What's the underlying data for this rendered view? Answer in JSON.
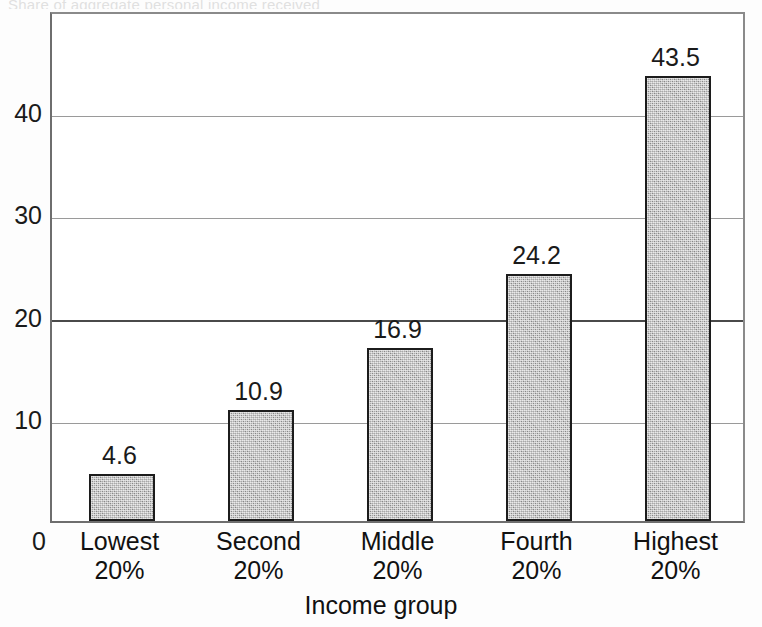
{
  "figure": {
    "cropped_title_sliver": "Share of aggregate personal income received",
    "background_color": "#ffffff",
    "bar_fill_color": "#a8a8a8",
    "bar_border_color": "#1c1c1c",
    "axis_color": "#6e6e6e",
    "gridline_color": "#9a9a9a",
    "emphasis_gridline_color": "#4a4a4a"
  },
  "chart_data": {
    "type": "bar",
    "title": "",
    "xlabel": "Income group",
    "ylabel": "",
    "categories": [
      "Lowest 20%",
      "Second 20%",
      "Middle 20%",
      "Fourth 20%",
      "Highest 20%"
    ],
    "category_lines": [
      [
        "Lowest",
        "20%"
      ],
      [
        "Second",
        "20%"
      ],
      [
        "Middle",
        "20%"
      ],
      [
        "Fourth",
        "20%"
      ],
      [
        "Highest",
        "20%"
      ]
    ],
    "values": [
      4.6,
      10.9,
      16.9,
      24.2,
      43.5
    ],
    "value_labels": [
      "4.6",
      "10.9",
      "16.9",
      "24.2",
      "43.5"
    ],
    "ylim": [
      0,
      50
    ],
    "yticks": [
      0,
      10,
      20,
      30,
      40
    ],
    "ytick_labels": [
      "0",
      "10",
      "20",
      "30",
      "40"
    ],
    "emphasized_gridline": 20,
    "grid": true,
    "legend": "none",
    "data_labels_shown": true
  }
}
